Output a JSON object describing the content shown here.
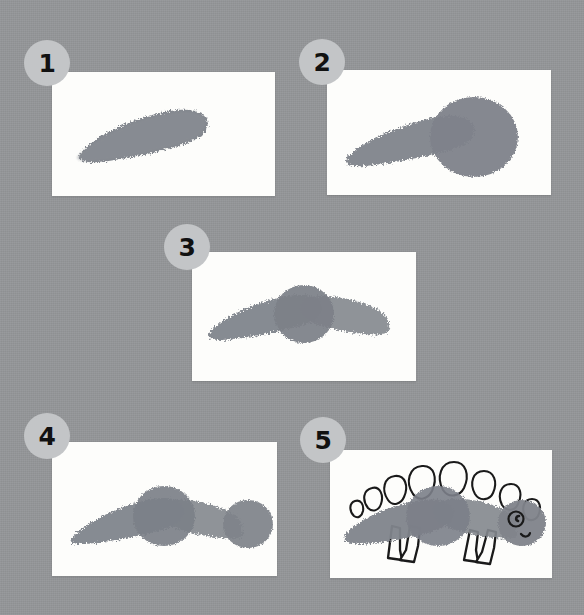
{
  "page": {
    "background_color": "#949699",
    "card_color": "#fdfdfb",
    "badge_color": "#c3c5c7",
    "badge_text_color": "#111111",
    "paint_color": "#80848b",
    "ink_color": "#1a1a1a"
  },
  "steps": [
    {
      "number": "1",
      "name": "step-1",
      "caption": "Sponge one tapered stroke for the tail and back",
      "card": {
        "x": 52,
        "y": 72,
        "w": 223,
        "h": 124
      },
      "badge": {
        "x": 24,
        "y": 40
      },
      "shapes": [
        "tail-stroke"
      ]
    },
    {
      "number": "2",
      "name": "step-2",
      "caption": "Add a round blob for the body",
      "card": {
        "x": 327,
        "y": 70,
        "w": 224,
        "h": 125
      },
      "badge": {
        "x": 299,
        "y": 39
      },
      "shapes": [
        "tail-stroke",
        "body-blob"
      ]
    },
    {
      "number": "3",
      "name": "step-3",
      "caption": "Sponge a second stroke to the right for the neck",
      "card": {
        "x": 192,
        "y": 252,
        "w": 224,
        "h": 129
      },
      "badge": {
        "x": 164,
        "y": 224
      },
      "shapes": [
        "tail-stroke",
        "body-blob",
        "neck-stroke"
      ]
    },
    {
      "number": "4",
      "name": "step-4",
      "caption": "Press a small circle on the end for the head",
      "card": {
        "x": 52,
        "y": 442,
        "w": 225,
        "h": 134
      },
      "badge": {
        "x": 24,
        "y": 413
      },
      "shapes": [
        "tail-stroke",
        "body-blob",
        "neck-stroke",
        "head-blob"
      ]
    },
    {
      "number": "5",
      "name": "step-5",
      "caption": "Draw plates, four legs, an eye and a smile",
      "card": {
        "x": 330,
        "y": 450,
        "w": 222,
        "h": 128
      },
      "badge": {
        "x": 300,
        "y": 417
      },
      "shapes": [
        "tail-stroke",
        "body-blob",
        "neck-stroke",
        "head-blob",
        "plates",
        "legs",
        "eye",
        "mouth"
      ]
    }
  ],
  "details": {
    "plate_count": 8,
    "leg_count": 4,
    "eye_label": "eye",
    "mouth_label": "smile"
  }
}
